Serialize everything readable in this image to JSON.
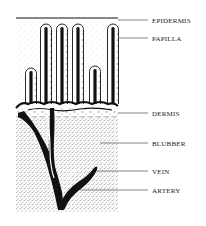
{
  "diagram": {
    "labels": [
      {
        "id": "epidermis",
        "text": "EPIDERMIS"
      },
      {
        "id": "papilla",
        "text": "PAPILLA"
      },
      {
        "id": "dermis",
        "text": "DERMIS"
      },
      {
        "id": "blubber",
        "text": "BLUBBER"
      },
      {
        "id": "vein",
        "text": "VEIN"
      },
      {
        "id": "artery",
        "text": "ARTERY"
      }
    ],
    "papillae_count": 6,
    "colors": {
      "ink": "#111111",
      "stipple": "#555555",
      "background": "#ffffff"
    }
  }
}
